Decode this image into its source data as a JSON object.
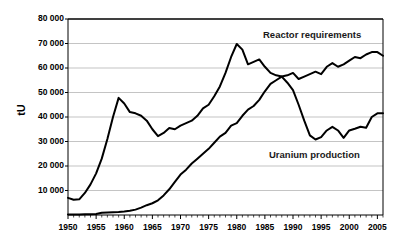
{
  "chart_data": {
    "type": "line",
    "title": "",
    "xlabel": "",
    "ylabel": "tU",
    "xlim": [
      1950,
      2006
    ],
    "ylim": [
      0,
      80000
    ],
    "grid": true,
    "legend_position": "inline-annotations",
    "y_ticks": [
      "10 000",
      "20 000",
      "30 000",
      "40 000",
      "50 000",
      "60 000",
      "70 000",
      "80 000"
    ],
    "y_tick_values": [
      10000,
      20000,
      30000,
      40000,
      50000,
      60000,
      70000,
      80000
    ],
    "x_ticks": [
      "1950",
      "1955",
      "1960",
      "1965",
      "1970",
      "1975",
      "1980",
      "1985",
      "1990",
      "1995",
      "2000",
      "2005"
    ],
    "x_tick_values": [
      1950,
      1955,
      1960,
      1965,
      1970,
      1975,
      1980,
      1985,
      1990,
      1995,
      2000,
      2005
    ],
    "x": [
      1950,
      1951,
      1952,
      1953,
      1954,
      1955,
      1956,
      1957,
      1958,
      1959,
      1960,
      1961,
      1962,
      1963,
      1964,
      1965,
      1966,
      1967,
      1968,
      1969,
      1970,
      1971,
      1972,
      1973,
      1974,
      1975,
      1976,
      1977,
      1978,
      1979,
      1980,
      1981,
      1982,
      1983,
      1984,
      1985,
      1986,
      1987,
      1988,
      1989,
      1990,
      1991,
      1992,
      1993,
      1994,
      1995,
      1996,
      1997,
      1998,
      1999,
      2000,
      2001,
      2002,
      2003,
      2004,
      2005,
      2006
    ],
    "series": [
      {
        "name": "Uranium production",
        "color": "#000000",
        "values": [
          7000,
          6200,
          6400,
          9000,
          12500,
          17000,
          23000,
          31000,
          40000,
          47800,
          45500,
          42000,
          41500,
          40500,
          38500,
          35000,
          32200,
          33500,
          35500,
          35000,
          36500,
          37500,
          38500,
          40500,
          43500,
          45000,
          48500,
          52500,
          58000,
          64500,
          69800,
          67500,
          61500,
          62500,
          63500,
          60500,
          58000,
          57000,
          56500,
          54000,
          51000,
          45000,
          38500,
          32500,
          30800,
          31800,
          34500,
          36000,
          34500,
          31500,
          34500,
          35200,
          36000,
          35600,
          40000,
          41500,
          41500
        ]
      },
      {
        "name": "Reactor requirements",
        "color": "#000000",
        "values": [
          200,
          220,
          250,
          280,
          320,
          400,
          900,
          1000,
          1100,
          1200,
          1400,
          1700,
          2200,
          3000,
          4000,
          4800,
          6000,
          8000,
          10500,
          13500,
          16500,
          18500,
          21000,
          23000,
          25000,
          27000,
          29500,
          32000,
          33500,
          36500,
          37500,
          40500,
          43000,
          44500,
          47000,
          50500,
          53500,
          55000,
          56500,
          57000,
          58000,
          55500,
          56500,
          57500,
          58500,
          57500,
          60500,
          62000,
          60500,
          61500,
          63000,
          64500,
          64000,
          65500,
          66500,
          66500,
          65000
        ]
      }
    ],
    "annotations": [
      {
        "text": "Reactor requirements",
        "x": 1995,
        "y": 75000
      },
      {
        "text": "Uranium production",
        "x": 1996,
        "y": 27000
      }
    ]
  },
  "plot": {
    "left": 68,
    "top": 19,
    "right": 383,
    "bottom": 215,
    "grid_color": "#aaaaaa",
    "axis_color": "#000000",
    "background": "#ffffff"
  }
}
